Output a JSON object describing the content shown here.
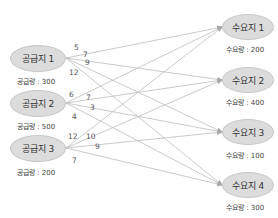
{
  "diagram": {
    "type": "transportation-network",
    "supply_nodes": [
      {
        "id": "S1",
        "label": "공급지 1",
        "caption": "공급량 : 300",
        "supply": 300
      },
      {
        "id": "S2",
        "label": "공급지 2",
        "caption": "공급량 : 500",
        "supply": 500
      },
      {
        "id": "S3",
        "label": "공급지 3",
        "caption": "공급량 : 200",
        "supply": 200
      }
    ],
    "demand_nodes": [
      {
        "id": "D1",
        "label": "수요지 1",
        "caption": "수요량 : 200",
        "demand": 200
      },
      {
        "id": "D2",
        "label": "수요지 2",
        "caption": "수요량 : 400",
        "demand": 400
      },
      {
        "id": "D3",
        "label": "수요지 3",
        "caption": "수요량 : 100",
        "demand": 100
      },
      {
        "id": "D4",
        "label": "수요지 4",
        "caption": "수요량 : 300",
        "demand": 300
      }
    ],
    "edges": [
      {
        "from": "S1",
        "to": "D1",
        "cost": "5"
      },
      {
        "from": "S1",
        "to": "D2",
        "cost": "7"
      },
      {
        "from": "S1",
        "to": "D3",
        "cost": "9"
      },
      {
        "from": "S1",
        "to": "D4",
        "cost": "12"
      },
      {
        "from": "S2",
        "to": "D1",
        "cost": "6"
      },
      {
        "from": "S2",
        "to": "D2",
        "cost": "7"
      },
      {
        "from": "S2",
        "to": "D3",
        "cost": "3"
      },
      {
        "from": "S2",
        "to": "D4",
        "cost": "4"
      },
      {
        "from": "S3",
        "to": "D1",
        "cost": "12"
      },
      {
        "from": "S3",
        "to": "D2",
        "cost": "10"
      },
      {
        "from": "S3",
        "to": "D3",
        "cost": "9"
      },
      {
        "from": "S3",
        "to": "D4",
        "cost": "7"
      }
    ],
    "colors": {
      "node_fill": "#dcdcdc",
      "edge": "#b4b4b4",
      "text": "#333333"
    }
  }
}
